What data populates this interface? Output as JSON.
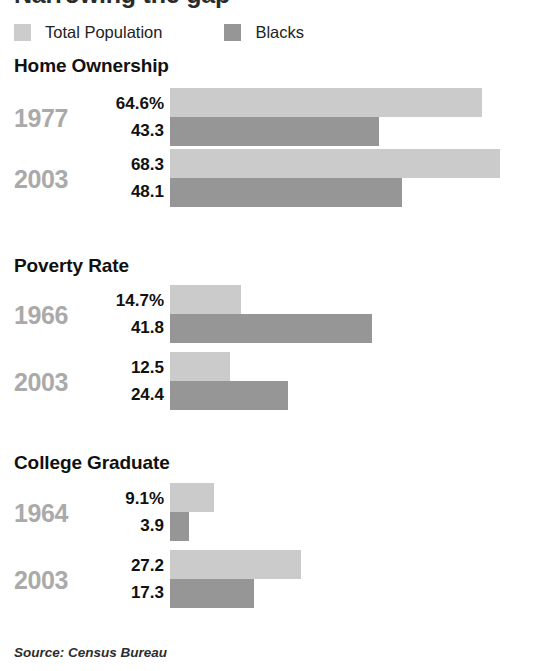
{
  "clipped_title": "Narrowing the gap",
  "legend": {
    "items": [
      {
        "label": "Total Population",
        "swatch": "light",
        "color": "#cccccc"
      },
      {
        "label": "Blacks",
        "swatch": "dark",
        "color": "#969696"
      }
    ]
  },
  "source": "Source: Census Bureau",
  "colors": {
    "total_population": "#cbcbcb",
    "blacks": "#969696",
    "year_label": "#aaaaaa",
    "value_label": "#111111",
    "background": "#ffffff"
  },
  "chart_data": {
    "type": "bar",
    "title": "Narrowing the gap",
    "orientation": "horizontal",
    "xlabel": "",
    "ylabel": "",
    "unit": "percent",
    "px_per_unit": 4.83,
    "bar_origin_px": 170,
    "grid": false,
    "legend_position": "top-left",
    "series": [
      {
        "name": "Total Population",
        "color": "#cbcbcb"
      },
      {
        "name": "Blacks",
        "color": "#969696"
      }
    ],
    "sections": [
      {
        "title": "Home Ownership",
        "top": 55,
        "groups": [
          {
            "year": "1977",
            "top": 88,
            "total_population": {
              "display": "64.6%",
              "value": 64.6
            },
            "blacks": {
              "display": "43.3",
              "value": 43.3
            }
          },
          {
            "year": "2003",
            "top": 149,
            "total_population": {
              "display": "68.3",
              "value": 68.3
            },
            "blacks": {
              "display": "48.1",
              "value": 48.1
            }
          }
        ]
      },
      {
        "title": "Poverty Rate",
        "top": 255,
        "groups": [
          {
            "year": "1966",
            "top": 285,
            "total_population": {
              "display": "14.7%",
              "value": 14.7
            },
            "blacks": {
              "display": "41.8",
              "value": 41.8
            }
          },
          {
            "year": "2003",
            "top": 352,
            "total_population": {
              "display": "12.5",
              "value": 12.5
            },
            "blacks": {
              "display": "24.4",
              "value": 24.4
            }
          }
        ]
      },
      {
        "title": "College Graduate",
        "top": 452,
        "groups": [
          {
            "year": "1964",
            "top": 483,
            "total_population": {
              "display": "9.1%",
              "value": 9.1
            },
            "blacks": {
              "display": "3.9",
              "value": 3.9
            }
          },
          {
            "year": "2003",
            "top": 550,
            "total_population": {
              "display": "27.2",
              "value": 27.2
            },
            "blacks": {
              "display": "17.3",
              "value": 17.3
            }
          }
        ]
      }
    ]
  }
}
